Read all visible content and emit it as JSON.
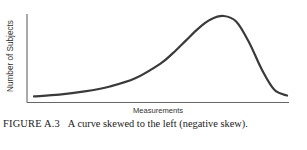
{
  "chart_data": {
    "type": "line",
    "title": "",
    "xlabel": "Measurements",
    "ylabel": "Number of Subjects",
    "grid": false,
    "legend": null,
    "xticks": [],
    "yticks": [],
    "x": [
      0,
      0.1,
      0.2,
      0.3,
      0.4,
      0.5,
      0.55,
      0.6,
      0.65,
      0.7,
      0.75,
      0.8,
      0.85,
      0.9,
      0.95,
      1.0
    ],
    "series": [
      {
        "name": "Distribution",
        "values": [
          0.02,
          0.04,
          0.08,
          0.14,
          0.24,
          0.42,
          0.55,
          0.7,
          0.85,
          0.96,
          1.0,
          0.93,
          0.68,
          0.35,
          0.1,
          0.03
        ]
      }
    ],
    "xlim": [
      0,
      1
    ],
    "ylim": [
      0,
      1.05
    ]
  },
  "caption": {
    "label": "FIGURE A.3",
    "text": "A curve skewed to the left (negative skew)."
  }
}
